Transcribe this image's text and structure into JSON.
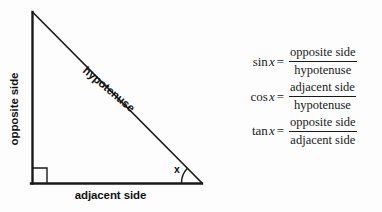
{
  "diagram": {
    "name": "right-triangle-trigonometry-diagram",
    "labels": {
      "opposite": "opposite side",
      "adjacent": "adjacent side",
      "hypotenuse": "hypotenuse",
      "angle": "x"
    },
    "colors": {
      "stroke": "#1a1a1a",
      "background": "#fdfdfd",
      "text": "#111111"
    },
    "geometry": {
      "apex": [
        32,
        12
      ],
      "bottom_left": [
        32,
        183
      ],
      "bottom_right": [
        202,
        183
      ],
      "right_angle_marker_size": 14,
      "angle_arc_radius": 21
    }
  },
  "formulas": [
    {
      "function": "sin",
      "lhs": "sin",
      "variable": "x",
      "equals": "=",
      "numerator": "opposite side",
      "denominator": "hypotenuse"
    },
    {
      "function": "cos",
      "lhs": "cos",
      "variable": "x",
      "equals": "=",
      "numerator": "adjacent side",
      "denominator": "hypotenuse"
    },
    {
      "function": "tan",
      "lhs": "tan",
      "variable": "x",
      "equals": "=",
      "numerator": "opposite side",
      "denominator": "adjacent side"
    }
  ]
}
